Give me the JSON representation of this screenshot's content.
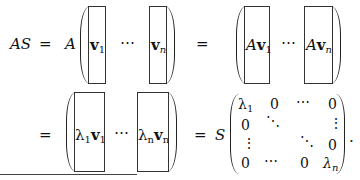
{
  "equation": {
    "line1": {
      "lhs": "AS",
      "eq1": "=",
      "coef": "A",
      "col1": {
        "base": "v",
        "sub": "1"
      },
      "dots": "⋯",
      "coln": {
        "base": "v",
        "sub": "n"
      },
      "eq2": "=",
      "acol1": {
        "pre": "A",
        "base": "v",
        "sub": "1"
      },
      "adots": "⋯",
      "acoln": {
        "pre": "A",
        "base": "v",
        "sub": "n"
      }
    },
    "line2": {
      "eq1": "=",
      "lcol1": {
        "lambda": "λ",
        "lsub": "1",
        "base": "v",
        "sub": "1"
      },
      "dots": "⋯",
      "lcoln": {
        "lambda": "λ",
        "lsub": "n",
        "base": "v",
        "sub": "n"
      },
      "eq2": "=",
      "coef": "S",
      "matrix": [
        [
          "λ1",
          "0",
          "⋯",
          "0"
        ],
        [
          "0",
          "⋱",
          "",
          "⋮"
        ],
        [
          "⋮",
          "",
          "⋱",
          "0"
        ],
        [
          "0",
          "⋯",
          "0",
          "λn"
        ]
      ],
      "m00": {
        "base": "λ",
        "sub": "1"
      },
      "m01": "0",
      "m02": "⋯",
      "m03": "0",
      "m10": "0",
      "m11": "⋱",
      "m13": "⋮",
      "m20": "⋮",
      "m22": "⋱",
      "m23": "0",
      "m30": "0",
      "m31": "⋯",
      "m32": "0",
      "m33": {
        "base": "λ",
        "sub": "n"
      },
      "period": "."
    }
  }
}
